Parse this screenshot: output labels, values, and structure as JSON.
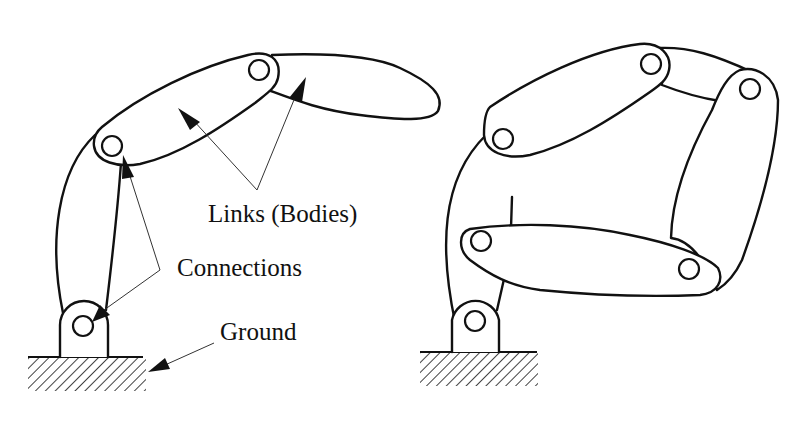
{
  "figure": {
    "type": "mechanism-diagram",
    "panels": [
      {
        "id": "left",
        "description": "open serial chain of three links on a grounded pin support"
      },
      {
        "id": "right",
        "description": "closed-loop linkage of links on a grounded pin support"
      }
    ]
  },
  "labels": {
    "links": "Links (Bodies)",
    "connections": "Connections",
    "ground": "Ground"
  },
  "colors": {
    "line": "#111111",
    "leader": "#333333",
    "background": "#ffffff"
  }
}
